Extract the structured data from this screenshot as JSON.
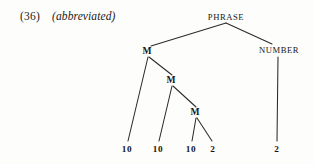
{
  "example": {
    "number": "(36)",
    "note": "(abbreviated)"
  },
  "colors": {
    "ink": "#1a1a1a",
    "line": "#2b2b2b",
    "page": "#fdfdfb"
  },
  "tree": {
    "root": "PHRASE",
    "nodes": {
      "phrase": "PHRASE",
      "number": "NUMBER",
      "m1": "M",
      "m2": "M",
      "m3": "M"
    },
    "leaves": {
      "leaf1": "10",
      "leaf2": "10",
      "leaf3": "10",
      "leaf4": "2",
      "number_leaf": "2"
    }
  }
}
